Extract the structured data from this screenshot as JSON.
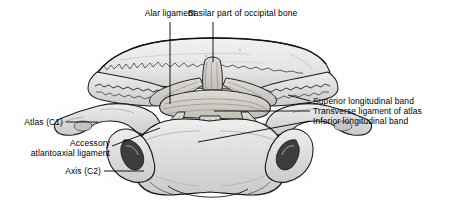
{
  "figure": {
    "background_color": "#ffffff",
    "ink_color": "#000000",
    "bone_fill_light": "#e9e9e9",
    "bone_fill_mid": "#cfcfcf",
    "bone_fill_dark": "#9a9a9a",
    "ligament_fill": "#d8d6d2"
  },
  "labels": {
    "alar_ligament": "Alar ligament",
    "basilar_part": "Basilar part of occipital bone",
    "superior_band": "Superior longitudinal band",
    "transverse_ligament": "Transverse ligament of atlas",
    "inferior_band": "Inferior longitudinal band",
    "atlas": "Atlas (C1)",
    "accessory_line1": "Accessory",
    "accessory_line2": "atlantoaxial ligament",
    "axis": "Axis (C2)"
  }
}
